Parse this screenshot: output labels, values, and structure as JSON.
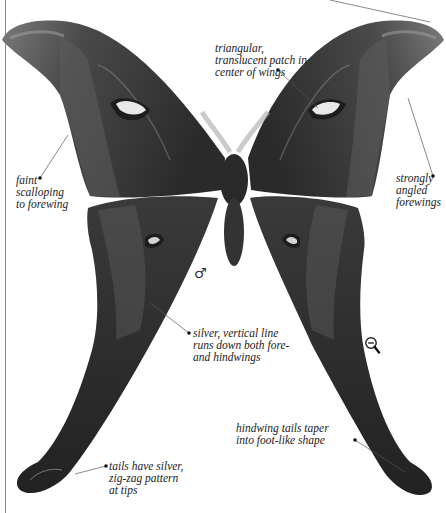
{
  "figure": {
    "sex_symbol": "♂",
    "palette": {
      "background": "#ffffff",
      "wing_dark": "#2e2e2e",
      "wing_mid": "#555555",
      "wing_margin": "#6a6a6a",
      "highlight": "#d8d8d8",
      "leader_line": "#555555"
    }
  },
  "annotations": [
    {
      "id": "patch",
      "text": "triangular,\ntranslucent patch in\ncenter of wings"
    },
    {
      "id": "scalloping",
      "text": "faint\nscalloping\nto forewing"
    },
    {
      "id": "angled",
      "text": "strongly\nangled\nforewings"
    },
    {
      "id": "silver-line",
      "text": "silver, vertical line\nruns down both fore-\nand hindwings"
    },
    {
      "id": "tails-taper",
      "text": "hindwing tails taper\ninto foot-like shape"
    },
    {
      "id": "tails-silver",
      "text": "tails have silver,\nzig-zag pattern\nat tips"
    }
  ],
  "controls": {
    "zoom_out_icon": "zoom-out-icon"
  }
}
